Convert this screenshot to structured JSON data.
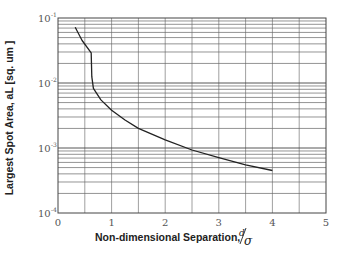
{
  "chart_data": {
    "type": "line",
    "title": "",
    "xlabel": "Non-dimensional Separation,",
    "xlabel_symbol_num": "d",
    "xlabel_symbol_den": "σ",
    "ylabel": "Largest Spot Area, aL [sq. um  ]",
    "xlim": [
      0,
      5
    ],
    "ylim": [
      0.0001,
      0.1
    ],
    "yscale": "log",
    "grid": true,
    "x_minor_step": 0.5,
    "x_ticks": [
      0,
      1,
      2,
      3,
      4,
      5
    ],
    "x_tick_labels": [
      "0",
      "1",
      "2",
      "3",
      "4",
      "5"
    ],
    "y_ticks": [
      0.1,
      0.01,
      0.001,
      0.0001
    ],
    "y_tick_labels": [
      {
        "base": "10",
        "exp": "-1"
      },
      {
        "base": "10",
        "exp": "-2"
      },
      {
        "base": "10",
        "exp": "-3"
      },
      {
        "base": "10",
        "exp": "-4"
      }
    ],
    "series": [
      {
        "name": "Largest spot area",
        "color": "#222222",
        "x": [
          0.32,
          0.45,
          0.62,
          0.63,
          0.66,
          0.8,
          1.0,
          1.25,
          1.5,
          2.0,
          2.5,
          3.0,
          3.5,
          4.0
        ],
        "y": [
          0.072,
          0.045,
          0.029,
          0.0125,
          0.0083,
          0.0055,
          0.0038,
          0.0027,
          0.002,
          0.00133,
          0.00093,
          0.00071,
          0.00055,
          0.00045
        ]
      }
    ]
  }
}
